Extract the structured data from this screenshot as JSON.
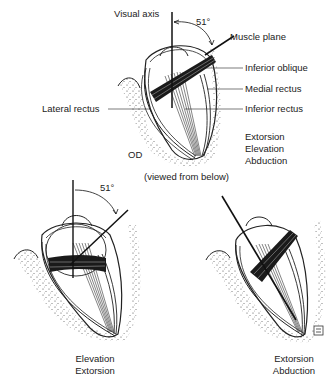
{
  "top_figure": {
    "eye": "OD",
    "view_note": "(viewed from below)",
    "angle": "51°",
    "labels": {
      "visual_axis": "Visual axis",
      "muscle_plane": "Muscle plane",
      "inferior_oblique": "Inferior oblique",
      "medial_rectus": "Medial rectus",
      "inferior_rectus": "Inferior rectus",
      "lateral_rectus": "Lateral rectus"
    },
    "actions": [
      "Extorsion",
      "Elevation",
      "Abduction"
    ]
  },
  "bottom_left_figure": {
    "angle": "51°",
    "actions": [
      "Elevation",
      "Extorsion"
    ]
  },
  "bottom_right_figure": {
    "actions": [
      "Extorsion",
      "Abduction"
    ]
  }
}
